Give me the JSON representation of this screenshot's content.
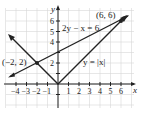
{
  "chart_data": {
    "type": "line",
    "title": "",
    "xlabel": "x",
    "ylabel": "y",
    "xlim": [
      -5,
      7
    ],
    "ylim": [
      -2,
      7
    ],
    "grid": true,
    "x_ticks": [
      "-4",
      "-3",
      "-2",
      "-1",
      "1",
      "2",
      "3",
      "4",
      "5",
      "6"
    ],
    "y_ticks": [
      "2",
      "4",
      "5",
      "6"
    ],
    "series": [
      {
        "name": "2y - x = 6",
        "points": [
          [
            -4.6,
            0.7
          ],
          [
            6.8,
            6.4
          ]
        ]
      },
      {
        "name": "y = |x|",
        "points": [
          [
            -4.5,
            4.5
          ],
          [
            0,
            0
          ],
          [
            6.6,
            6.6
          ]
        ]
      }
    ],
    "annotations": [
      {
        "text": "(-2, 2)",
        "x": -2,
        "y": 2
      },
      {
        "text": "(6, 6)",
        "x": 6,
        "y": 6
      },
      {
        "text": "2y - x = 6"
      },
      {
        "text": "y = |x|"
      }
    ]
  },
  "labels": {
    "x_axis": "x",
    "y_axis": "y",
    "line1": "2y − x = 6",
    "line2": "y = |x|",
    "pt1": "(−2, 2)",
    "pt2": "(6, 6)",
    "xt": [
      "−4",
      "−3",
      "−2",
      "−1",
      "1",
      "2",
      "3",
      "4",
      "5",
      "6"
    ],
    "yt": [
      "2",
      "4",
      "5",
      "6"
    ]
  }
}
